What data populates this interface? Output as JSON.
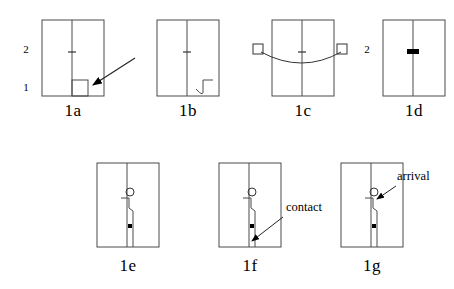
{
  "figure": {
    "width": 454,
    "height": 289,
    "background": "#ffffff",
    "stroke_color": "#000000",
    "fill_color": "#000000"
  },
  "panels": [
    {
      "id": "1a",
      "label": "1a",
      "label_x": 73,
      "label_y": 110,
      "frame": {
        "x": 42,
        "y": 20,
        "w": 62,
        "h": 76
      },
      "divider_x": 72,
      "tick_y": 52,
      "features": [
        "small-rectangle-bottom-right",
        "arrow-pointing-to-rectangle"
      ],
      "small_rect": {
        "x": 72,
        "y": 80,
        "w": 16,
        "h": 16
      },
      "arrow": {
        "x1": 135,
        "y1": 58,
        "x2": 92,
        "y2": 85
      }
    },
    {
      "id": "1b",
      "label": "1b",
      "label_x": 188,
      "label_y": 110,
      "frame": {
        "x": 157,
        "y": 20,
        "w": 62,
        "h": 76
      },
      "divider_x": 187,
      "tick_y": 52,
      "features": [
        "hook-bottom-right"
      ],
      "small_rect": {
        "x": 196,
        "y": 80,
        "w": 16,
        "h": 16
      }
    },
    {
      "id": "1c",
      "label": "1c",
      "label_x": 303,
      "label_y": 110,
      "frame": {
        "x": 272,
        "y": 20,
        "w": 62,
        "h": 76
      },
      "divider_x": 302,
      "tick_y": 52,
      "features": [
        "sagging-curve",
        "left-end-square",
        "right-end-square"
      ],
      "left_square": {
        "x": 253,
        "y": 44,
        "w": 10,
        "h": 10
      },
      "right_square": {
        "x": 337,
        "y": 44,
        "w": 10,
        "h": 10
      },
      "curve_sag_y": 62
    },
    {
      "id": "1d",
      "label": "1d",
      "label_x": 414,
      "label_y": 110,
      "frame": {
        "x": 383,
        "y": 20,
        "w": 62,
        "h": 76
      },
      "divider_x": 413,
      "tick_y": 52,
      "features": [
        "thick-black-marker-on-divider"
      ],
      "marker": {
        "x": 407,
        "y": 49,
        "w": 12,
        "h": 5
      }
    },
    {
      "id": "1e",
      "label": "1e",
      "label_x": 128,
      "label_y": 265,
      "frame": {
        "x": 97,
        "y": 163,
        "w": 62,
        "h": 84
      },
      "divider_x": 127,
      "features": [
        "open-circle",
        "stepped-polyline",
        "small-filled-square"
      ],
      "circle": {
        "cx": 130,
        "cy": 192,
        "r": 4
      },
      "filled_square": {
        "x": 128,
        "y": 224,
        "w": 4,
        "h": 4
      }
    },
    {
      "id": "1f",
      "label": "1f",
      "label_x": 250,
      "label_y": 265,
      "frame": {
        "x": 219,
        "y": 163,
        "w": 62,
        "h": 84
      },
      "divider_x": 249,
      "features": [
        "open-circle",
        "stepped-polyline",
        "small-filled-square",
        "contact-annotation"
      ],
      "circle": {
        "cx": 252,
        "cy": 192,
        "r": 4
      },
      "filled_square": {
        "x": 250,
        "y": 224,
        "w": 4,
        "h": 4
      }
    },
    {
      "id": "1g",
      "label": "1g",
      "label_x": 372,
      "label_y": 265,
      "frame": {
        "x": 341,
        "y": 163,
        "w": 62,
        "h": 84
      },
      "divider_x": 371,
      "features": [
        "open-circle",
        "stepped-polyline",
        "small-filled-square",
        "arrival-annotation"
      ],
      "circle": {
        "cx": 374,
        "cy": 192,
        "r": 4
      },
      "filled_square": {
        "x": 372,
        "y": 224,
        "w": 4,
        "h": 4
      }
    }
  ],
  "axis_labels": [
    {
      "text": "2",
      "x": 26,
      "y": 50,
      "for_panel": "1a"
    },
    {
      "text": "1",
      "x": 26,
      "y": 88,
      "for_panel": "1a"
    },
    {
      "text": "2",
      "x": 367,
      "y": 50,
      "for_panel": "1d"
    }
  ],
  "annotations": [
    {
      "text": "contact",
      "label_x": 286,
      "label_y": 208,
      "arrow": {
        "x1": 283,
        "y1": 217,
        "x2": 251,
        "y2": 241
      },
      "for_panel": "1f"
    },
    {
      "text": "arrival",
      "label_x": 397,
      "label_y": 177,
      "arrow": {
        "x1": 396,
        "y1": 186,
        "x2": 376,
        "y2": 199
      },
      "for_panel": "1g"
    }
  ]
}
